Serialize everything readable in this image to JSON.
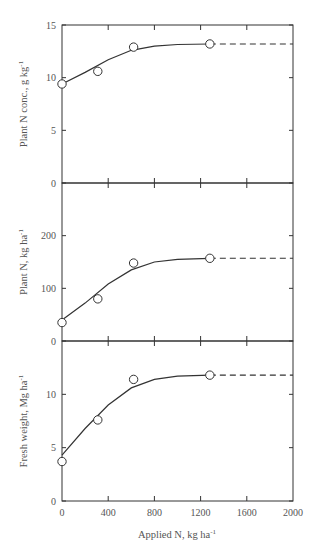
{
  "chart_data": {
    "type": "line",
    "layout": "three vertically stacked panels sharing x-axis",
    "xlabel": "Applied N, kg ha⁻¹",
    "x_ticks": [
      0,
      400,
      800,
      1200,
      1600,
      2000
    ],
    "xlim": [
      0,
      2000
    ],
    "grid": false,
    "panels": [
      {
        "ylabel": "Plant N conc., g kg⁻¹",
        "ylim": [
          0,
          15
        ],
        "y_ticks": [
          0,
          5,
          10,
          15
        ],
        "points": {
          "x": [
            0,
            310,
            620,
            1280
          ],
          "y": [
            9.4,
            10.6,
            12.9,
            13.2
          ]
        },
        "fit_curve": {
          "x": [
            0,
            200,
            400,
            600,
            800,
            1000,
            1280
          ],
          "y": [
            9.4,
            10.5,
            11.7,
            12.6,
            13.0,
            13.15,
            13.2
          ]
        },
        "plateau_dashed": {
          "x": [
            1280,
            2000
          ],
          "y": 13.2
        }
      },
      {
        "ylabel": "Plant N, kg ha⁻¹",
        "ylim": [
          0,
          300
        ],
        "y_ticks": [
          0,
          100,
          200
        ],
        "points": {
          "x": [
            0,
            310,
            620,
            1280
          ],
          "y": [
            35,
            80,
            148,
            157
          ]
        },
        "fit_curve": {
          "x": [
            0,
            200,
            400,
            600,
            800,
            1000,
            1280
          ],
          "y": [
            40,
            72,
            108,
            135,
            150,
            155,
            157
          ]
        },
        "plateau_dashed": {
          "x": [
            1280,
            2000
          ],
          "y": 157
        }
      },
      {
        "ylabel": "Fresh weight, Mg ha⁻¹",
        "ylim": [
          0,
          15
        ],
        "y_ticks": [
          0,
          5,
          10
        ],
        "points": {
          "x": [
            0,
            310,
            620,
            1280
          ],
          "y": [
            3.7,
            7.6,
            11.4,
            11.8
          ]
        },
        "fit_curve": {
          "x": [
            0,
            200,
            400,
            600,
            800,
            1000,
            1280
          ],
          "y": [
            4.3,
            6.8,
            9.0,
            10.6,
            11.4,
            11.7,
            11.8
          ]
        },
        "plateau_dashed": {
          "x": [
            1280,
            2000
          ],
          "y": 11.8
        }
      }
    ]
  },
  "labels": {
    "xlabel_main": "Applied N, kg ha",
    "xlabel_sup": "-1",
    "panel1_ylabel_main": "Plant N conc., g kg",
    "panel2_ylabel_main": "Plant N, kg ha",
    "panel3_ylabel_main": "Fresh weight, Mg ha",
    "ylabel_sup": "-1"
  }
}
